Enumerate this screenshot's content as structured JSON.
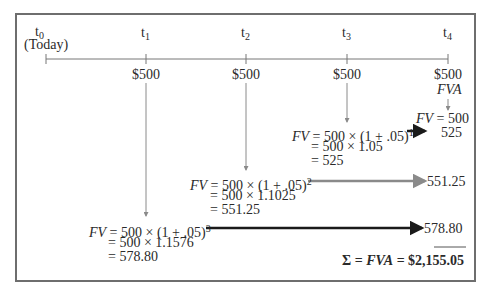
{
  "timeline": {
    "periods": [
      {
        "label": "t",
        "sub": "0",
        "note": "(Today)",
        "payment": ""
      },
      {
        "label": "t",
        "sub": "1",
        "payment": "$500"
      },
      {
        "label": "t",
        "sub": "2",
        "payment": "$500"
      },
      {
        "label": "t",
        "sub": "3",
        "payment": "$500"
      },
      {
        "label": "t",
        "sub": "4",
        "payment": "$500",
        "payment_note": "FVA"
      }
    ]
  },
  "calculations": [
    {
      "period": "t4",
      "line1_fv": "FV",
      "line1_rest": " = 500",
      "result": "525"
    },
    {
      "period": "t3",
      "fv": "FV",
      "formula": " = 500 × (1 + .05)",
      "exponent": "1",
      "step2": "= 500 × 1.05",
      "step3": "= 525",
      "result": "525"
    },
    {
      "period": "t2",
      "fv": "FV",
      "formula": " = 500 × (1 + .05)",
      "exponent": "2",
      "step2": "= 500 × 1.1025",
      "step3": "= 551.25",
      "result": "551.25"
    },
    {
      "period": "t1",
      "fv": "FV",
      "formula": " = 500 × (1 + .05)",
      "exponent": "3",
      "step2": "= 500 × 1.1576",
      "step3": "= 578.80",
      "result": "578.80"
    }
  ],
  "total": {
    "sigma": "Σ",
    "eq1": " = ",
    "fva": "FVA",
    "eq2": " = $2,155.05"
  },
  "colors": {
    "border": "#6e6e6e",
    "arrow_gray": "#8a8a8a",
    "arrow_dark": "#1a1a1a",
    "text": "#2a2a2a"
  }
}
